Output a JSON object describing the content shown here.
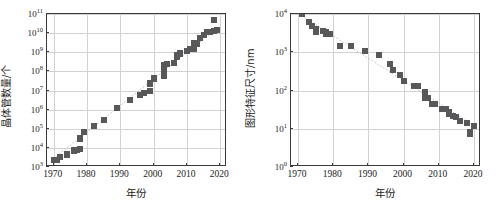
{
  "figure": {
    "title": "",
    "panels": [
      "left",
      "right"
    ]
  },
  "chart_data": [
    {
      "id": "transistor-count",
      "type": "scatter",
      "title": "",
      "xlabel": "年份",
      "ylabel": "晶体管数量/个",
      "xlim": [
        1968,
        2022
      ],
      "ylim_log10": [
        3,
        11
      ],
      "yscale": "log",
      "xticks": [
        1970,
        1980,
        1990,
        2000,
        2010,
        2020
      ],
      "xtick_labels": [
        "1970",
        "1980",
        "1990",
        "2000",
        "2010",
        "2020"
      ],
      "yticks_log10": [
        3,
        4,
        5,
        6,
        7,
        8,
        9,
        10,
        11
      ],
      "ytick_labels": [
        "10^3",
        "10^4",
        "10^5",
        "10^6",
        "10^7",
        "10^8",
        "10^9",
        "10^10",
        "10^11"
      ],
      "grid": true,
      "legend": null,
      "marker": "square",
      "marker_color": "#58585a",
      "trendline": {
        "style": "dotted",
        "color": "#b9b9b9",
        "from": [
          1970,
          2200
        ],
        "to": [
          2019,
          14000000000.0
        ]
      },
      "points": [
        {
          "x": 1970,
          "y": 2200
        },
        {
          "x": 1971,
          "y": 2300
        },
        {
          "x": 1972,
          "y": 3500
        },
        {
          "x": 1974,
          "y": 4500
        },
        {
          "x": 1974,
          "y": 5000
        },
        {
          "x": 1976,
          "y": 6500
        },
        {
          "x": 1976,
          "y": 8000
        },
        {
          "x": 1977,
          "y": 7500
        },
        {
          "x": 1978,
          "y": 9000
        },
        {
          "x": 1978,
          "y": 29000
        },
        {
          "x": 1978,
          "y": 31000
        },
        {
          "x": 1979,
          "y": 68000
        },
        {
          "x": 1982,
          "y": 134000
        },
        {
          "x": 1985,
          "y": 275000
        },
        {
          "x": 1989,
          "y": 1180000
        },
        {
          "x": 1993,
          "y": 3100000
        },
        {
          "x": 1996,
          "y": 5500000
        },
        {
          "x": 1996,
          "y": 6000000
        },
        {
          "x": 1997,
          "y": 7500000
        },
        {
          "x": 1999,
          "y": 9500000
        },
        {
          "x": 1999,
          "y": 21000000
        },
        {
          "x": 1999,
          "y": 24000000
        },
        {
          "x": 2000,
          "y": 42000000
        },
        {
          "x": 2000,
          "y": 45000000
        },
        {
          "x": 2003,
          "y": 54000000
        },
        {
          "x": 2003,
          "y": 106000000
        },
        {
          "x": 2003,
          "y": 220000000
        },
        {
          "x": 2004,
          "y": 230000000
        },
        {
          "x": 2006,
          "y": 290000000
        },
        {
          "x": 2007,
          "y": 580000000
        },
        {
          "x": 2007,
          "y": 680000000
        },
        {
          "x": 2008,
          "y": 800000000
        },
        {
          "x": 2008,
          "y": 900000000
        },
        {
          "x": 2010,
          "y": 1200000000
        },
        {
          "x": 2011,
          "y": 1400000000
        },
        {
          "x": 2012,
          "y": 3100000000
        },
        {
          "x": 2012,
          "y": 1400000000
        },
        {
          "x": 2013,
          "y": 2600000000
        },
        {
          "x": 2014,
          "y": 5500000000
        },
        {
          "x": 2015,
          "y": 8000000000
        },
        {
          "x": 2016,
          "y": 11000000000.0
        },
        {
          "x": 2017,
          "y": 12000000000.0
        },
        {
          "x": 2018,
          "y": 13000000000.0
        },
        {
          "x": 2018,
          "y": 48000000000.0
        },
        {
          "x": 2019,
          "y": 14000000000.0
        }
      ]
    },
    {
      "id": "feature-size",
      "type": "scatter",
      "title": "",
      "xlabel": "年份",
      "ylabel": "图形特征尺寸/nm",
      "xlim": [
        1968,
        2022
      ],
      "ylim_log10": [
        0,
        4
      ],
      "yscale": "log",
      "xticks": [
        1970,
        1980,
        1990,
        2000,
        2010,
        2020
      ],
      "xtick_labels": [
        "1970",
        "1980",
        "1990",
        "2000",
        "2010",
        "2020"
      ],
      "yticks_log10": [
        0,
        1,
        2,
        3,
        4
      ],
      "ytick_labels": [
        "10^0",
        "10^1",
        "10^2",
        "10^3",
        "10^4"
      ],
      "grid": true,
      "legend": null,
      "marker": "square",
      "marker_color": "#58585a",
      "trendline": {
        "style": "dotted",
        "color": "#b9b9b9",
        "from": [
          1971,
          9000
        ],
        "to": [
          2020,
          12
        ]
      },
      "points": [
        {
          "x": 1971,
          "y": 10000
        },
        {
          "x": 1973,
          "y": 6000
        },
        {
          "x": 1974,
          "y": 5000
        },
        {
          "x": 1975,
          "y": 4000
        },
        {
          "x": 1975,
          "y": 3300
        },
        {
          "x": 1977,
          "y": 3500
        },
        {
          "x": 1978,
          "y": 3300
        },
        {
          "x": 1978,
          "y": 3000
        },
        {
          "x": 1979,
          "y": 3000
        },
        {
          "x": 1982,
          "y": 1500
        },
        {
          "x": 1985,
          "y": 1500
        },
        {
          "x": 1989,
          "y": 1050
        },
        {
          "x": 1993,
          "y": 850
        },
        {
          "x": 1996,
          "y": 500
        },
        {
          "x": 1997,
          "y": 350
        },
        {
          "x": 1999,
          "y": 250
        },
        {
          "x": 2000,
          "y": 180
        },
        {
          "x": 2003,
          "y": 130
        },
        {
          "x": 2004,
          "y": 130
        },
        {
          "x": 2006,
          "y": 90
        },
        {
          "x": 2006,
          "y": 65
        },
        {
          "x": 2007,
          "y": 65
        },
        {
          "x": 2008,
          "y": 45
        },
        {
          "x": 2009,
          "y": 45
        },
        {
          "x": 2011,
          "y": 32
        },
        {
          "x": 2012,
          "y": 32
        },
        {
          "x": 2013,
          "y": 28
        },
        {
          "x": 2013,
          "y": 25
        },
        {
          "x": 2014,
          "y": 22
        },
        {
          "x": 2015,
          "y": 20
        },
        {
          "x": 2016,
          "y": 16
        },
        {
          "x": 2018,
          "y": 14
        },
        {
          "x": 2020,
          "y": 12
        },
        {
          "x": 2019,
          "y": 7.5
        },
        {
          "x": 2019,
          "y": 8
        }
      ]
    }
  ]
}
